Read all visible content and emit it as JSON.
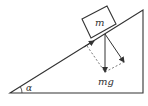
{
  "diagram": {
    "type": "inclined-plane-free-body",
    "labels": {
      "mass": "m",
      "weight": "mg",
      "angle": "α"
    },
    "colors": {
      "stroke": "#333333",
      "background": "#ffffff"
    }
  }
}
